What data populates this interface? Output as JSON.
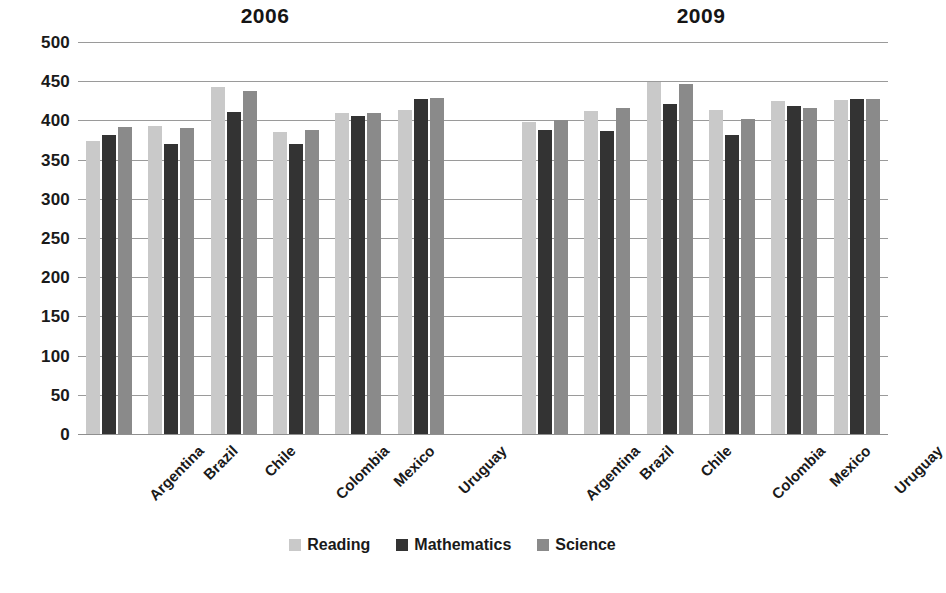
{
  "chart_data": {
    "type": "bar",
    "title": "",
    "xlabel": "",
    "ylabel": "",
    "ylim": [
      0,
      500
    ],
    "ytick_step": 50,
    "ytick_labels": [
      "500",
      "450",
      "400",
      "350",
      "300",
      "250",
      "200",
      "150",
      "100",
      "50",
      "0"
    ],
    "grid": true,
    "legend_position": "bottom",
    "categories": [
      "Argentina",
      "Brazil",
      "Chile",
      "Colombia",
      "Mexico",
      "Uruguay"
    ],
    "groups": [
      {
        "label": "2006",
        "series": [
          {
            "name": "Reading",
            "color": "#c9c9c9",
            "values": [
              374,
              393,
              442,
              385,
              410,
              413
            ]
          },
          {
            "name": "Mathematics",
            "color": "#333333",
            "values": [
              381,
              370,
              411,
              370,
              406,
              427
            ]
          },
          {
            "name": "Science",
            "color": "#8a8a8a",
            "values": [
              391,
              390,
              438,
              388,
              410,
              428
            ]
          }
        ]
      },
      {
        "label": "2009",
        "series": [
          {
            "name": "Reading",
            "color": "#c9c9c9",
            "values": [
              398,
              412,
              449,
              413,
              425,
              426
            ]
          },
          {
            "name": "Mathematics",
            "color": "#333333",
            "values": [
              388,
              386,
              421,
              381,
              419,
              427
            ]
          },
          {
            "name": "Science",
            "color": "#8a8a8a",
            "values": [
              401,
              416,
              447,
              402,
              416,
              427
            ]
          }
        ]
      }
    ],
    "legend": [
      {
        "name": "Reading",
        "color": "#c9c9c9"
      },
      {
        "name": "Mathematics",
        "color": "#333333"
      },
      {
        "name": "Science",
        "color": "#8a8a8a"
      }
    ]
  }
}
